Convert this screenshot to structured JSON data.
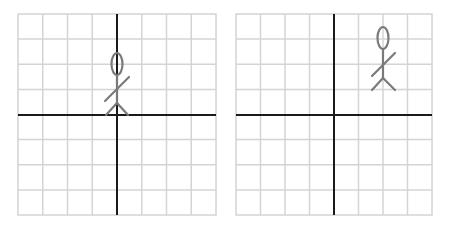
{
  "diagram": {
    "colors": {
      "grid": "#d4d4d4",
      "axis": "#1a1a1a",
      "figure": "#7a7a7a",
      "background": "#ffffff"
    },
    "grids": [
      {
        "name": "original",
        "cells": 8,
        "figure_position": {
          "x": 0,
          "y": 2
        },
        "description": "Stick figure standing on origin"
      },
      {
        "name": "translated",
        "cells": 8,
        "figure_position": {
          "x": 2,
          "y": 3
        },
        "description": "Stick figure moved 2 right and 1 up"
      }
    ]
  }
}
